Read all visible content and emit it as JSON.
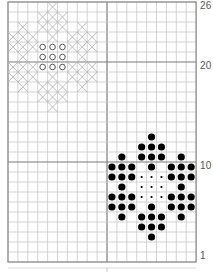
{
  "grid": {
    "cols": 19,
    "rows": 26,
    "origin_x": 8,
    "origin_y": 2,
    "cell_w": 9.9,
    "cell_h": 10,
    "heavy_cols": [
      10
    ],
    "heavy_rows": [
      6,
      16
    ],
    "colors": {
      "fine": "#c8c8c8",
      "heavy": "#7a7a7a",
      "border": "#8a8a8a"
    }
  },
  "row_labels": [
    {
      "text": "26",
      "row": 0
    },
    {
      "text": "20",
      "row": 6
    },
    {
      "text": "10",
      "row": 16
    },
    {
      "text": "1",
      "row": 25
    }
  ],
  "patterns": {
    "cross_motif": {
      "symbol": "cross",
      "color": "#b5b5b5",
      "cells": [
        [
          0,
          4
        ],
        [
          1,
          3
        ],
        [
          1,
          4
        ],
        [
          1,
          5
        ],
        [
          2,
          1
        ],
        [
          2,
          3
        ],
        [
          2,
          4
        ],
        [
          2,
          5
        ],
        [
          2,
          7
        ],
        [
          3,
          0
        ],
        [
          3,
          1
        ],
        [
          3,
          2
        ],
        [
          3,
          4
        ],
        [
          3,
          6
        ],
        [
          3,
          7
        ],
        [
          3,
          8
        ],
        [
          4,
          0
        ],
        [
          4,
          1
        ],
        [
          4,
          2
        ],
        [
          4,
          6
        ],
        [
          4,
          7
        ],
        [
          4,
          8
        ],
        [
          5,
          1
        ],
        [
          5,
          7
        ],
        [
          6,
          0
        ],
        [
          6,
          1
        ],
        [
          6,
          2
        ],
        [
          6,
          6
        ],
        [
          6,
          7
        ],
        [
          6,
          8
        ],
        [
          7,
          0
        ],
        [
          7,
          1
        ],
        [
          7,
          2
        ],
        [
          7,
          4
        ],
        [
          7,
          6
        ],
        [
          7,
          7
        ],
        [
          7,
          8
        ],
        [
          8,
          1
        ],
        [
          8,
          3
        ],
        [
          8,
          4
        ],
        [
          8,
          5
        ],
        [
          8,
          7
        ],
        [
          9,
          3
        ],
        [
          9,
          4
        ],
        [
          9,
          5
        ],
        [
          10,
          4
        ]
      ]
    },
    "ring_center": {
      "symbol": "ring",
      "color": "#555555",
      "cells": [
        [
          4,
          3
        ],
        [
          4,
          4
        ],
        [
          4,
          5
        ],
        [
          5,
          3
        ],
        [
          5,
          4
        ],
        [
          5,
          5
        ],
        [
          6,
          3
        ],
        [
          6,
          4
        ],
        [
          6,
          5
        ]
      ]
    },
    "dot_motif": {
      "symbol": "large-dot",
      "color": "#000000",
      "cells": [
        [
          13,
          14
        ],
        [
          14,
          13
        ],
        [
          14,
          14
        ],
        [
          14,
          15
        ],
        [
          15,
          11
        ],
        [
          15,
          13
        ],
        [
          15,
          14
        ],
        [
          15,
          15
        ],
        [
          15,
          17
        ],
        [
          16,
          10
        ],
        [
          16,
          11
        ],
        [
          16,
          12
        ],
        [
          16,
          14
        ],
        [
          16,
          16
        ],
        [
          16,
          17
        ],
        [
          16,
          18
        ],
        [
          17,
          10
        ],
        [
          17,
          11
        ],
        [
          17,
          12
        ],
        [
          17,
          16
        ],
        [
          17,
          17
        ],
        [
          17,
          18
        ],
        [
          18,
          11
        ],
        [
          18,
          17
        ],
        [
          19,
          10
        ],
        [
          19,
          11
        ],
        [
          19,
          12
        ],
        [
          19,
          16
        ],
        [
          19,
          17
        ],
        [
          19,
          18
        ],
        [
          20,
          10
        ],
        [
          20,
          11
        ],
        [
          20,
          12
        ],
        [
          20,
          14
        ],
        [
          20,
          16
        ],
        [
          20,
          17
        ],
        [
          20,
          18
        ],
        [
          21,
          11
        ],
        [
          21,
          13
        ],
        [
          21,
          14
        ],
        [
          21,
          15
        ],
        [
          21,
          17
        ],
        [
          22,
          13
        ],
        [
          22,
          14
        ],
        [
          22,
          15
        ],
        [
          23,
          14
        ]
      ]
    },
    "small_dot_center": {
      "symbol": "small-dot",
      "color": "#000000",
      "cells": [
        [
          17,
          13
        ],
        [
          17,
          14
        ],
        [
          17,
          15
        ],
        [
          18,
          13
        ],
        [
          18,
          14
        ],
        [
          18,
          15
        ],
        [
          19,
          13
        ],
        [
          19,
          14
        ],
        [
          19,
          15
        ]
      ]
    }
  }
}
